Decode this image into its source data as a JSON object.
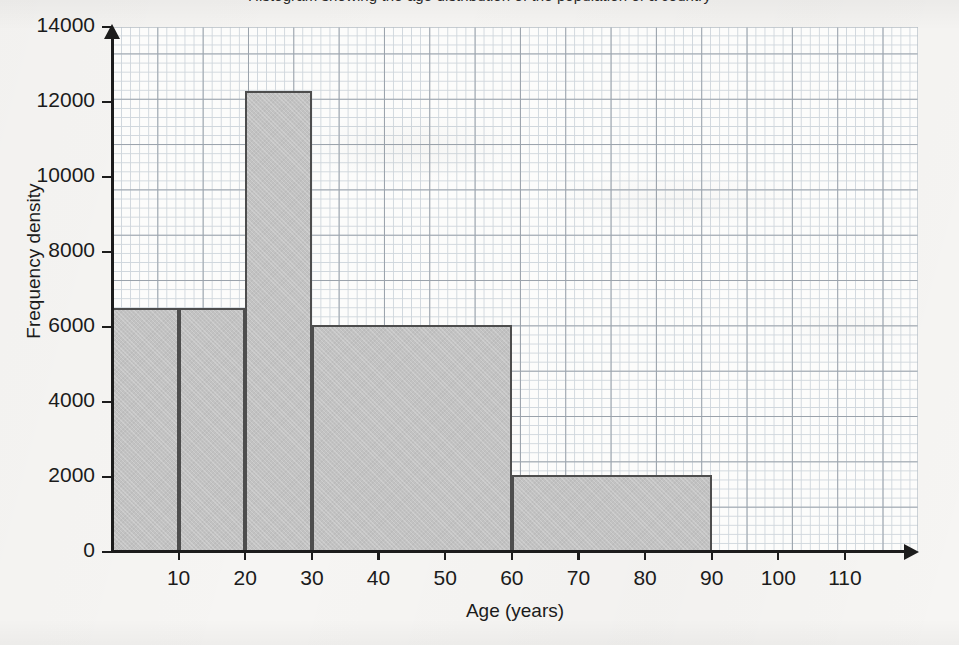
{
  "chart_data": {
    "type": "bar",
    "title": "Histogram showing the age distribution of the population of a country",
    "subtitle": "",
    "xlabel": "Age (years)",
    "ylabel": "Frequency density",
    "xlim": [
      0,
      110
    ],
    "ylim": [
      0,
      14000
    ],
    "xticks": [
      0,
      10,
      20,
      30,
      40,
      50,
      60,
      70,
      80,
      90,
      100,
      110
    ],
    "xtick_labels": [
      "0",
      "10",
      "20",
      "30",
      "40",
      "50",
      "60",
      "70",
      "80",
      "90",
      "100",
      "110"
    ],
    "yticks": [
      0,
      2000,
      4000,
      6000,
      8000,
      10000,
      12000,
      14000
    ],
    "ytick_labels": [
      "0",
      "2000",
      "4000",
      "6000",
      "8000",
      "10000",
      "12000",
      "14000"
    ],
    "grid": true,
    "grid_type": "graph-paper",
    "legend": false,
    "bars": [
      {
        "label": "0-10",
        "x_start": 0,
        "x_end": 10,
        "value": 6500,
        "width": 10
      },
      {
        "label": "10-20",
        "x_start": 10,
        "x_end": 20,
        "value": 6500,
        "width": 10
      },
      {
        "label": "20-30",
        "x_start": 20,
        "x_end": 30,
        "value": 12300,
        "width": 10
      },
      {
        "label": "30-60",
        "x_start": 30,
        "x_end": 60,
        "value": 6050,
        "width": 30
      },
      {
        "label": "60-90",
        "x_start": 60,
        "x_end": 90,
        "value": 2050,
        "width": 30
      }
    ],
    "colors": {
      "bar_fill": "#c2c2c2",
      "bar_border": "#4d4d4d",
      "axis": "#1c1c1c",
      "grid_minor": "#cfd6dc",
      "grid_major": "#9aa2ab",
      "background": "#f6f5f3",
      "text": "#1b1b1b"
    }
  }
}
